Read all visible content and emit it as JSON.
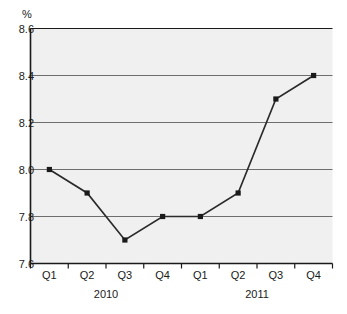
{
  "chart_data": {
    "type": "line",
    "title": "",
    "subtitle": "",
    "xlabel": "",
    "ylabel": "%",
    "unit_label": "%",
    "ylim": [
      7.6,
      8.6
    ],
    "ystep": 0.2,
    "grid": true,
    "legend": "none",
    "marker": "square",
    "line_color": "#2b2b2b",
    "marker_color": "#1a1a1a",
    "plot_bg_color": "#f0f0f0",
    "grid_color": "#6e6e6e",
    "axis_color": "#1a1a1a",
    "categories": [
      "Q1",
      "Q2",
      "Q3",
      "Q4",
      "Q1",
      "Q2",
      "Q3",
      "Q4"
    ],
    "values": [
      8.0,
      7.9,
      7.7,
      7.8,
      7.8,
      7.9,
      8.3,
      8.4
    ],
    "ytick_labels": [
      "8.6",
      "8.4",
      "8.2",
      "8.0",
      "7.8",
      "7.6"
    ],
    "ytick_values": [
      8.6,
      8.4,
      8.2,
      8.0,
      7.8,
      7.6
    ],
    "groups": [
      {
        "label": "2010",
        "categories": [
          "Q1",
          "Q2",
          "Q3",
          "Q4"
        ]
      },
      {
        "label": "2011",
        "categories": [
          "Q1",
          "Q2",
          "Q3",
          "Q4"
        ]
      }
    ],
    "points": [
      {
        "group": "2010",
        "quarter": "Q1",
        "value": 8.0
      },
      {
        "group": "2010",
        "quarter": "Q2",
        "value": 7.9
      },
      {
        "group": "2010",
        "quarter": "Q3",
        "value": 7.7
      },
      {
        "group": "2010",
        "quarter": "Q4",
        "value": 7.8
      },
      {
        "group": "2011",
        "quarter": "Q1",
        "value": 7.8
      },
      {
        "group": "2011",
        "quarter": "Q2",
        "value": 7.9
      },
      {
        "group": "2011",
        "quarter": "Q3",
        "value": 8.3
      },
      {
        "group": "2011",
        "quarter": "Q4",
        "value": 8.4
      }
    ]
  }
}
